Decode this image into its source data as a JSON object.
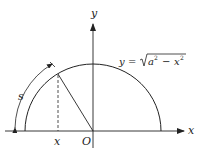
{
  "diagram": {
    "labels": {
      "y_axis": "y",
      "x_axis": "x",
      "origin": "O",
      "x_point": "x",
      "arc_length": "s",
      "equation_lhs": "y",
      "equation_eq": "=",
      "equation_a": "a",
      "equation_exp1": "2",
      "equation_minus": "−",
      "equation_x": "x",
      "equation_exp2": "2"
    },
    "equation": "y = √(a² − x²)",
    "colors": {
      "stroke": "#222222",
      "background": "#ffffff"
    }
  }
}
